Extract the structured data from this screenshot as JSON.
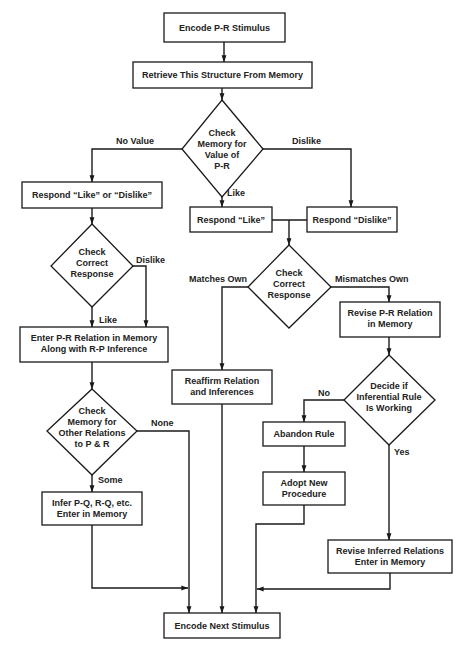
{
  "diagram": {
    "type": "flowchart",
    "colors": {
      "stroke": "#1a1a1a",
      "text": "#222222",
      "background": "#ffffff"
    },
    "nodes": {
      "encode_pr": {
        "shape": "box",
        "lines": [
          "Encode P-R Stimulus"
        ]
      },
      "retrieve": {
        "shape": "box",
        "lines": [
          "Retrieve This Structure From Memory"
        ]
      },
      "check_value": {
        "shape": "diamond",
        "lines": [
          "Check",
          "Memory for",
          "Value of",
          "P-R"
        ]
      },
      "respond_like_or_dislike": {
        "shape": "box",
        "lines": [
          "Respond “Like” or “Dislike”"
        ]
      },
      "respond_like": {
        "shape": "box",
        "lines": [
          "Respond “Like”"
        ]
      },
      "respond_dislike": {
        "shape": "box",
        "lines": [
          "Respond “Dislike”"
        ]
      },
      "check_correct_left": {
        "shape": "diamond",
        "lines": [
          "Check",
          "Correct",
          "Response"
        ]
      },
      "check_correct_right": {
        "shape": "diamond",
        "lines": [
          "Check",
          "Correct",
          "Response"
        ]
      },
      "enter_pr": {
        "shape": "box",
        "lines": [
          "Enter P-R Relation  in Memory",
          "Along with R-P Inference"
        ]
      },
      "check_other": {
        "shape": "diamond",
        "lines": [
          "Check",
          "Memory for",
          "Other Relations",
          "to P & R"
        ]
      },
      "infer_pq": {
        "shape": "box",
        "lines": [
          "Infer P-Q, R-Q, etc.",
          "Enter in Memory"
        ]
      },
      "reaffirm": {
        "shape": "box",
        "lines": [
          "Reaffirm Relation",
          "and Inferences"
        ]
      },
      "revise_pr": {
        "shape": "box",
        "lines": [
          "Revise P-R Relation",
          "in Memory"
        ]
      },
      "decide_rule": {
        "shape": "diamond",
        "lines": [
          "Decide if",
          "Inferential Rule",
          "Is Working"
        ]
      },
      "abandon": {
        "shape": "box",
        "lines": [
          "Abandon Rule"
        ]
      },
      "adopt": {
        "shape": "box",
        "lines": [
          "Adopt New",
          "Procedure"
        ]
      },
      "revise_inferred": {
        "shape": "box",
        "lines": [
          "Revise Inferred Relations",
          "Enter in Memory"
        ]
      },
      "encode_next": {
        "shape": "box",
        "lines": [
          "Encode Next Stimulus"
        ]
      }
    },
    "edge_labels": {
      "no_value": "No Value",
      "dislike_top": "Dislike",
      "like_top": "Like",
      "dislike_left": "Dislike",
      "like_left": "Like",
      "matches_own": "Matches Own",
      "mismatches_own": "Mismatches Own",
      "none": "None",
      "some": "Some",
      "no": "No",
      "yes": "Yes"
    },
    "edges": [
      {
        "from": "encode_pr",
        "to": "retrieve"
      },
      {
        "from": "retrieve",
        "to": "check_value"
      },
      {
        "from": "check_value",
        "to": "respond_like_or_dislike",
        "label": "No Value"
      },
      {
        "from": "check_value",
        "to": "respond_like",
        "label": "Like"
      },
      {
        "from": "check_value",
        "to": "respond_dislike",
        "label": "Dislike"
      },
      {
        "from": "respond_like",
        "to": "check_correct_right"
      },
      {
        "from": "respond_dislike",
        "to": "check_correct_right"
      },
      {
        "from": "respond_like_or_dislike",
        "to": "check_correct_left"
      },
      {
        "from": "check_correct_left",
        "to": "enter_pr",
        "label": "Like"
      },
      {
        "from": "check_correct_left",
        "to": "enter_pr",
        "label": "Dislike"
      },
      {
        "from": "enter_pr",
        "to": "check_other"
      },
      {
        "from": "check_other",
        "to": "infer_pq",
        "label": "Some"
      },
      {
        "from": "check_other",
        "to": "encode_next",
        "label": "None"
      },
      {
        "from": "infer_pq",
        "to": "encode_next"
      },
      {
        "from": "check_correct_right",
        "to": "reaffirm",
        "label": "Matches Own"
      },
      {
        "from": "check_correct_right",
        "to": "revise_pr",
        "label": "Mismatches Own"
      },
      {
        "from": "reaffirm",
        "to": "encode_next"
      },
      {
        "from": "revise_pr",
        "to": "decide_rule"
      },
      {
        "from": "decide_rule",
        "to": "abandon",
        "label": "No"
      },
      {
        "from": "decide_rule",
        "to": "revise_inferred",
        "label": "Yes"
      },
      {
        "from": "abandon",
        "to": "adopt"
      },
      {
        "from": "adopt",
        "to": "encode_next"
      },
      {
        "from": "revise_inferred",
        "to": "encode_next"
      }
    ]
  }
}
